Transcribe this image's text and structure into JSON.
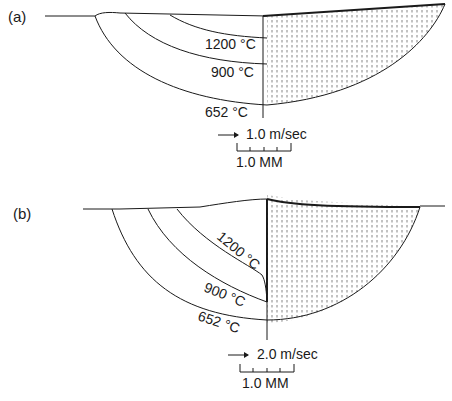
{
  "panel_a": {
    "label": "(a)",
    "isotherms": [
      "1200 °C",
      "900 °C",
      "652 °C"
    ],
    "velocity_scale": "1.0 m/sec",
    "length_scale": "1.0 MM"
  },
  "panel_b": {
    "label": "(b)",
    "isotherms": [
      "1200 °C",
      "900 °C",
      "652 °C"
    ],
    "velocity_scale": "2.0 m/sec",
    "length_scale": "1.0 MM"
  },
  "colors": {
    "ink": "#1a1a1a",
    "background": "#ffffff"
  }
}
